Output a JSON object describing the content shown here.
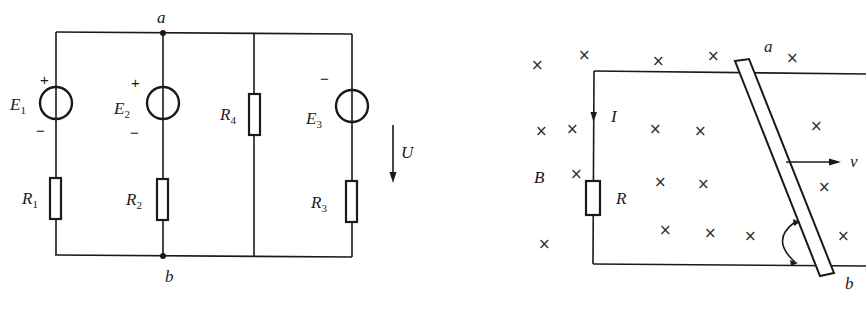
{
  "figures": [
    {
      "id": "circuit",
      "node_top": "a",
      "node_bottom": "b",
      "voltage_label": "U",
      "branches": [
        {
          "source": {
            "name": "E",
            "sub": "1",
            "top_sign": "+",
            "bottom_sign": "−"
          },
          "resistor": {
            "name": "R",
            "sub": "1"
          }
        },
        {
          "source": {
            "name": "E",
            "sub": "2",
            "top_sign": "+",
            "bottom_sign": "−"
          },
          "resistor": {
            "name": "R",
            "sub": "2"
          }
        },
        {
          "resistor": {
            "name": "R",
            "sub": "4"
          }
        },
        {
          "source": {
            "name": "E",
            "sub": "3",
            "top_sign": "−"
          },
          "resistor": {
            "name": "R",
            "sub": "3"
          }
        }
      ]
    },
    {
      "id": "rail-rod",
      "field_label": "B",
      "current_label": "I",
      "resistor_label": "R",
      "velocity_label": "v",
      "rod_top_label": "a",
      "rod_bottom_label": "b",
      "field_symbol": "×"
    }
  ]
}
